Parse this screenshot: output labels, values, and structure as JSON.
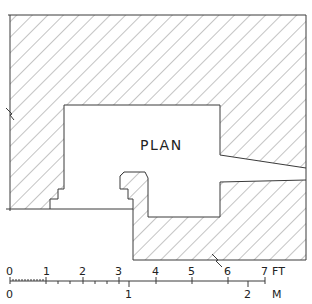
{
  "diagram": {
    "title": "PLAN",
    "type": "architectural floor plan",
    "hatch_color": "#8a8a8a",
    "line_color": "#3a3a3a",
    "background": "#ffffff"
  },
  "scale_bar": {
    "feet": {
      "unit": "FT",
      "ticks": [
        "0",
        "1",
        "2",
        "3",
        "4",
        "5",
        "6",
        "7"
      ]
    },
    "meters": {
      "unit": "M",
      "ticks": [
        "0",
        "1",
        "2"
      ]
    }
  }
}
